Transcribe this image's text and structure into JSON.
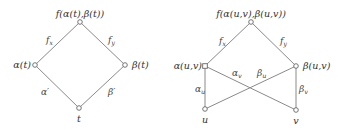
{
  "diagrams": [
    {
      "name": "single-variable",
      "nodes": [
        {
          "id": "top",
          "label": "f(α(t),β(t))"
        },
        {
          "id": "alpha",
          "label": "α(t)"
        },
        {
          "id": "beta",
          "label": "β(t)"
        },
        {
          "id": "t",
          "label": "t"
        }
      ],
      "edges": [
        {
          "from": "top",
          "to": "alpha",
          "label": "f_x",
          "base": "f",
          "sub": "x"
        },
        {
          "from": "top",
          "to": "beta",
          "label": "f_y",
          "base": "f",
          "sub": "y"
        },
        {
          "from": "alpha",
          "to": "t",
          "label": "α′"
        },
        {
          "from": "beta",
          "to": "t",
          "label": "β′"
        }
      ]
    },
    {
      "name": "two-variable",
      "nodes": [
        {
          "id": "top",
          "label": "f(α(u,v),β(u,v))"
        },
        {
          "id": "alpha",
          "label": "α(u,v)"
        },
        {
          "id": "beta",
          "label": "β(u,v)"
        },
        {
          "id": "u",
          "label": "u"
        },
        {
          "id": "v",
          "label": "v"
        }
      ],
      "edges": [
        {
          "from": "top",
          "to": "alpha",
          "label": "f_x",
          "base": "f",
          "sub": "x"
        },
        {
          "from": "top",
          "to": "beta",
          "label": "f_y",
          "base": "f",
          "sub": "y"
        },
        {
          "from": "alpha",
          "to": "u",
          "label": "α_u",
          "base": "α",
          "sub": "u"
        },
        {
          "from": "alpha",
          "to": "v",
          "label": "α_v",
          "base": "α",
          "sub": "v"
        },
        {
          "from": "beta",
          "to": "u",
          "label": "β_u",
          "base": "β",
          "sub": "u"
        },
        {
          "from": "beta",
          "to": "v",
          "label": "β_v",
          "base": "β",
          "sub": "v"
        }
      ]
    }
  ]
}
